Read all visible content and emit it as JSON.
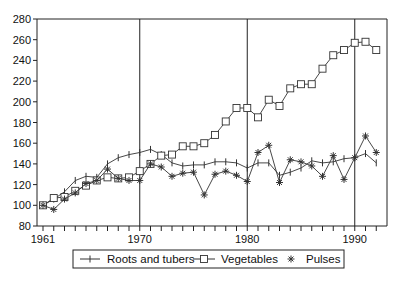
{
  "chart_data": {
    "type": "line",
    "title": "",
    "xlabel": "",
    "ylabel": "",
    "xlim": [
      1960.2,
      1992.6
    ],
    "ylim": [
      80,
      280
    ],
    "x_ticks_labeled": [
      1961,
      1970,
      1980,
      1990
    ],
    "y_ticks": [
      80,
      100,
      120,
      140,
      160,
      180,
      200,
      220,
      240,
      260,
      280
    ],
    "vertical_reference_lines": [
      1970,
      1980,
      1990
    ],
    "grid": false,
    "legend_position": "bottom",
    "x": [
      1961,
      1962,
      1963,
      1964,
      1965,
      1966,
      1967,
      1968,
      1969,
      1970,
      1971,
      1972,
      1973,
      1974,
      1975,
      1976,
      1977,
      1978,
      1979,
      1980,
      1981,
      1982,
      1983,
      1984,
      1985,
      1986,
      1987,
      1988,
      1989,
      1990,
      1991,
      1992
    ],
    "series": [
      {
        "name": "Roots and tubers",
        "marker": "plus",
        "values": [
          100,
          106,
          113,
          124,
          128,
          127,
          140,
          146,
          149,
          151,
          154,
          149,
          141,
          138,
          139,
          139,
          142,
          142,
          141,
          136,
          141,
          141,
          129,
          132,
          136,
          143,
          141,
          142,
          145,
          146,
          150,
          141
        ]
      },
      {
        "name": "Vegetables",
        "marker": "square",
        "values": [
          100,
          107,
          108,
          114,
          119,
          124,
          127,
          126,
          127,
          133,
          140,
          148,
          149,
          157,
          157,
          160,
          168,
          181,
          194,
          194,
          185,
          202,
          196,
          213,
          217,
          217,
          232,
          245,
          250,
          257,
          258,
          250
        ]
      },
      {
        "name": "Pulses",
        "marker": "asterisk",
        "values": [
          100,
          96,
          106,
          112,
          121,
          124,
          135,
          126,
          124,
          124,
          140,
          137,
          128,
          131,
          132,
          110,
          130,
          133,
          129,
          123,
          151,
          158,
          122,
          144,
          142,
          138,
          128,
          148,
          125,
          146,
          167,
          151
        ]
      }
    ]
  },
  "legend": {
    "items": [
      {
        "label": "Roots and tubers",
        "marker": "plus"
      },
      {
        "label": "Vegetables",
        "marker": "square"
      },
      {
        "label": "Pulses",
        "marker": "asterisk"
      }
    ]
  },
  "colors": {
    "line": "#333333",
    "axis": "#222222",
    "background": "#ffffff"
  }
}
